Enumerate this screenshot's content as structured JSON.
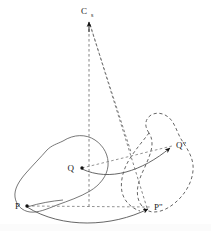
{
  "figure": {
    "background_color": "#ffffff",
    "stroke_color": "#555555",
    "label_color": "#1a1a1a",
    "width": 211,
    "height": 231,
    "labels": {
      "center": "C",
      "center_subscript": "s",
      "point_p": "P",
      "point_p_image": "P\"",
      "point_q": "Q",
      "point_q_image": "Q\""
    },
    "shapes": [
      {
        "name": "source-surface",
        "style": "solid",
        "description": "closed blob outline on the left containing points P and Q"
      },
      {
        "name": "target-surface",
        "style": "dashed",
        "description": "closed blob outline on the right containing points P-double-prime and Q-double-prime"
      }
    ],
    "projection_rays": [
      {
        "name": "ray-c-to-p",
        "style": "dashed",
        "from": "C",
        "to": "P-area-vertical"
      },
      {
        "name": "ray-c-to-p-image",
        "style": "dashed",
        "from": "C",
        "to": "P\""
      }
    ],
    "mapping_arrows": [
      {
        "name": "arrow-q-to-q-image",
        "style": "solid-curved",
        "from": "Q",
        "to": "Q\""
      },
      {
        "name": "arrow-p-to-p-image",
        "style": "dashed-straight",
        "from": "P",
        "to": "P\""
      },
      {
        "name": "arrow-p-curve-to-p-image",
        "style": "solid-curved",
        "from": "P",
        "to": "P\""
      },
      {
        "name": "arrow-q-to-q-image-dashed",
        "style": "dashed-straight",
        "from": "Q",
        "to": "Q\""
      }
    ],
    "markers": [
      {
        "name": "marker-c",
        "shape": "arrowhead-up"
      },
      {
        "name": "marker-p",
        "shape": "dot"
      },
      {
        "name": "marker-q",
        "shape": "dot"
      },
      {
        "name": "marker-p-image",
        "shape": "arrowhead"
      },
      {
        "name": "marker-q-image",
        "shape": "arrowhead"
      }
    ]
  }
}
